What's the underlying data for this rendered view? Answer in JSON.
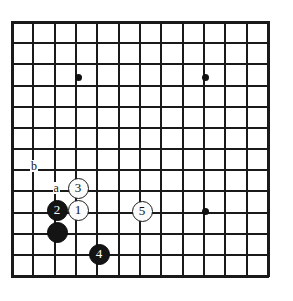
{
  "figure": {
    "kind": "go-board-diagram",
    "board": {
      "columns": 13,
      "rows": 13,
      "line_color": "#1a1a1a",
      "background_color": "#ffffff",
      "left_px": 12,
      "top_px": 22,
      "col_spacing_px": 21.33,
      "row_spacing_px": 21.17,
      "border_top_px": 22,
      "border_bottom_px": 276,
      "border_left_px": 12,
      "border_right_px": 268
    },
    "star_points": [
      {
        "name": "star-point-top-left",
        "col": 3,
        "row": 2,
        "x": 78,
        "y": 77
      },
      {
        "name": "star-point-top-right",
        "col": 9,
        "row": 2,
        "x": 205,
        "y": 77
      },
      {
        "name": "star-point-center-right",
        "col": 9,
        "row": 8,
        "x": 205,
        "y": 211
      }
    ],
    "stones": [
      {
        "name": "white-stone-1",
        "color": "white",
        "label": "1",
        "col": 3,
        "row": 8,
        "x": 78,
        "y": 210
      },
      {
        "name": "black-stone-2",
        "color": "black",
        "label": "2",
        "col": 2,
        "row": 8,
        "x": 57,
        "y": 210
      },
      {
        "name": "white-stone-3",
        "color": "white",
        "label": "3",
        "col": 3,
        "row": 7,
        "x": 78,
        "y": 188
      },
      {
        "name": "black-stone-4",
        "color": "black",
        "label": "4",
        "col": 4,
        "row": 10,
        "x": 99,
        "y": 254
      },
      {
        "name": "white-stone-5",
        "color": "white",
        "label": "5",
        "col": 6,
        "row": 8,
        "x": 142,
        "y": 211
      },
      {
        "name": "black-stone-corner",
        "color": "black",
        "label": "",
        "col": 2,
        "row": 9,
        "x": 57,
        "y": 232
      }
    ],
    "point_labels": [
      {
        "name": "point-label-b",
        "text": "b",
        "col": 1,
        "row": 6,
        "x": 34,
        "y": 166
      },
      {
        "name": "point-label-a",
        "text": "a",
        "col": 2,
        "row": 7,
        "x": 56,
        "y": 188
      }
    ]
  }
}
